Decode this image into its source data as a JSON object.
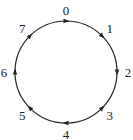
{
  "diagram": {
    "type": "cycle",
    "nodes": [
      {
        "label": "0",
        "angle": 0,
        "arrow_dir": 90
      },
      {
        "label": "1",
        "angle": 45,
        "arrow_dir": 135
      },
      {
        "label": "2",
        "angle": 90,
        "arrow_dir": 180
      },
      {
        "label": "3",
        "angle": 135,
        "arrow_dir": 45
      },
      {
        "label": "4",
        "angle": 180,
        "arrow_dir": 270
      },
      {
        "label": "5",
        "angle": 225,
        "arrow_dir": 315
      },
      {
        "label": "6",
        "angle": 270,
        "arrow_dir": 0
      },
      {
        "label": "7",
        "angle": 315,
        "arrow_dir": 45
      }
    ],
    "colors": {
      "stroke": "#222222",
      "background": "#ffffff"
    }
  }
}
